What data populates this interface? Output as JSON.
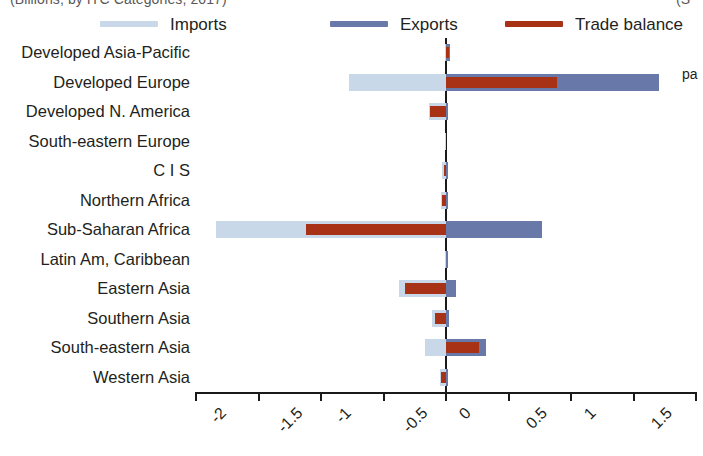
{
  "clipped_header": {
    "left_text": "(Billions, by ITC Categories, 2017)",
    "right_text": "(S",
    "side_note": "pa"
  },
  "legend": {
    "position": "top",
    "items": [
      {
        "label": "Imports",
        "color": "#c9d8e8",
        "icon": "line-swatch-icon",
        "x": 100
      },
      {
        "label": "Exports",
        "color": "#6878a8",
        "icon": "line-swatch-icon",
        "x": 330
      },
      {
        "label": "Trade balance",
        "color": "#a83216",
        "icon": "line-swatch-icon",
        "x": 505
      }
    ]
  },
  "chart_data": {
    "type": "bar",
    "orientation": "horizontal",
    "title": "",
    "subtitle": "",
    "xlabel": "",
    "ylabel": "",
    "xlim": [
      -2,
      2
    ],
    "grid": false,
    "zero_line": true,
    "legend_position": "top",
    "tick_values": [
      -2,
      -1.5,
      -1,
      -0.5,
      0,
      0.5,
      1,
      1.5,
      2
    ],
    "tick_labels": [
      "-2",
      "-1.5",
      "-1",
      "-0.5",
      "0",
      "0.5",
      "1",
      "1.5",
      "2"
    ],
    "categories": [
      "Developed Asia-Pacific",
      "Developed Europe",
      "Developed N. America",
      "South-eastern Europe",
      "C I S",
      "Northern Africa",
      "Sub-Saharan Africa",
      "Latin Am, Caribbean",
      "Eastern Asia",
      "Southern Asia",
      "South-eastern Asia",
      "Western Asia"
    ],
    "series": [
      {
        "name": "Imports",
        "color": "#c9d8e8",
        "values": [
          -0.01,
          -0.78,
          -0.14,
          -0.01,
          -0.03,
          -0.04,
          -1.84,
          -0.01,
          -0.38,
          -0.11,
          -0.17,
          -0.05
        ]
      },
      {
        "name": "Exports",
        "color": "#6878a8",
        "values": [
          0.03,
          1.7,
          0.01,
          0.0,
          0.01,
          0.01,
          0.77,
          0.01,
          0.08,
          0.02,
          0.32,
          0.01
        ]
      },
      {
        "name": "Trade balance",
        "color": "#a83216",
        "values": [
          0.02,
          0.89,
          -0.13,
          0.0,
          -0.02,
          -0.03,
          -1.12,
          0.0,
          -0.33,
          -0.09,
          0.26,
          -0.04
        ]
      }
    ]
  }
}
